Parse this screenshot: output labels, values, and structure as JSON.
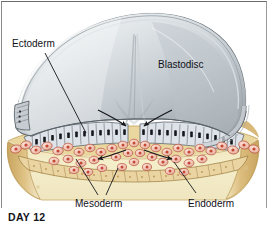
{
  "figure": {
    "caption": "DAY 12",
    "labels": {
      "ectoderm": "Ectoderm",
      "blastodisc": "Blastodisc",
      "mesoderm": "Mesoderm",
      "endoderm": "Endoderm"
    }
  },
  "colors": {
    "dome_light": "#f2f4f5",
    "dome_mid": "#c8cdd1",
    "dome_dark": "#8e969c",
    "dome_edge": "#5d666c",
    "yolk_pale": "#f4ecc8",
    "yolk_mid": "#e6d9a3",
    "yolk_tan": "#d9bd7f",
    "yolk_deep": "#c9a55f",
    "cell_fill": "#dfe4e8",
    "cell_line": "#6c7378",
    "nucleus": "#14161a",
    "meso_fill": "#f2c3b4",
    "meso_line": "#b8553f",
    "meso_nucleus": "#c24a35",
    "endo_fill": "#ecd9ae",
    "endo_line": "#9a7a3c",
    "label_text": "#111118",
    "leader_line": "#17171c",
    "frame": "#8a8a8a",
    "background": "#ffffff"
  },
  "annotations": {
    "migration_arrows": [
      {
        "name": "streak-ingress-left",
        "direction": "down-right"
      },
      {
        "name": "streak-ingress-right",
        "direction": "down-left"
      },
      {
        "name": "mesoderm-spread-left",
        "direction": "left"
      },
      {
        "name": "mesoderm-spread-right",
        "direction": "right"
      }
    ],
    "leader_lines": [
      "ectoderm",
      "mesoderm-left",
      "mesoderm-right",
      "endoderm"
    ]
  }
}
